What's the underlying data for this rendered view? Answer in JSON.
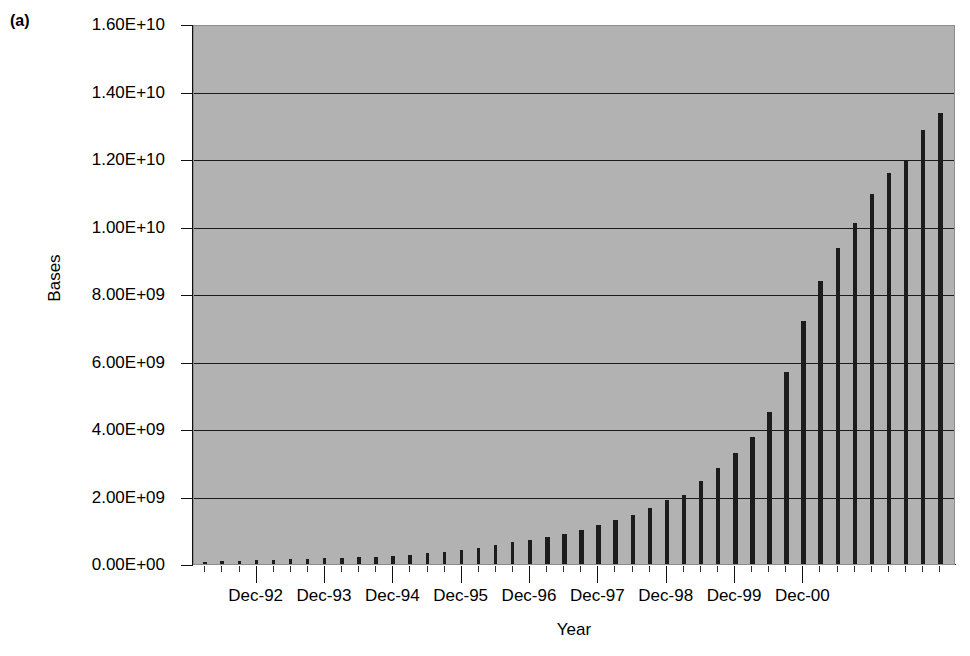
{
  "figure": {
    "panel_label": "(a)",
    "background_color": "#ffffff",
    "plot_background_color": "#b2b2b2",
    "bar_color": "#1c1c1c",
    "gridline_color": "#1a1a1a"
  },
  "axes": {
    "ylabel": "Bases",
    "xlabel": "Year",
    "ytick_labels": [
      "0.00E+00",
      "2.00E+09",
      "4.00E+09",
      "6.00E+09",
      "8.00E+09",
      "1.00E+10",
      "1.20E+10",
      "1.40E+10",
      "1.60E+10"
    ],
    "ytick_values": [
      0,
      2000000000,
      4000000000,
      6000000000,
      8000000000,
      10000000000,
      12000000000,
      14000000000,
      16000000000
    ],
    "xtick_labels": [
      "Dec-92",
      "Dec-93",
      "Dec-94",
      "Dec-95",
      "Dec-96",
      "Dec-97",
      "Dec-98",
      "Dec-99",
      "Dec-00"
    ]
  },
  "chart_data": {
    "type": "bar",
    "title": "",
    "subtitle": "",
    "xlabel": "Year",
    "ylabel": "Bases",
    "ylim": [
      0,
      16000000000
    ],
    "ytick_labels": [
      "0.00E+00",
      "2.00E+09",
      "4.00E+09",
      "6.00E+09",
      "8.00E+09",
      "1.00E+10",
      "1.20E+10",
      "1.40E+10",
      "1.60E+10"
    ],
    "grid": true,
    "legend": null,
    "legend_position": "none",
    "annotations": [
      "(a)"
    ],
    "categories": [
      "Mar-92",
      "Jun-92",
      "Sep-92",
      "Dec-92",
      "Mar-93",
      "Jun-93",
      "Sep-93",
      "Dec-93",
      "Mar-94",
      "Jun-94",
      "Sep-94",
      "Dec-94",
      "Mar-95",
      "Jun-95",
      "Sep-95",
      "Dec-95",
      "Mar-96",
      "Jun-96",
      "Sep-96",
      "Dec-96",
      "Mar-97",
      "Jun-97",
      "Sep-97",
      "Dec-97",
      "Mar-98",
      "Jun-98",
      "Sep-98",
      "Dec-98",
      "Mar-99",
      "Jun-99",
      "Sep-99",
      "Dec-99",
      "Mar-00",
      "Jun-00",
      "Sep-00",
      "Dec-00",
      "Mar-01",
      "Jun-01"
    ],
    "values": [
      60000000,
      75000000,
      90000000,
      105000000,
      120000000,
      135000000,
      150000000,
      165000000,
      180000000,
      200000000,
      220000000,
      250000000,
      280000000,
      320000000,
      360000000,
      420000000,
      480000000,
      560000000,
      640000000,
      720000000,
      810000000,
      900000000,
      1020000000,
      1150000000,
      1300000000,
      1450000000,
      1650000000,
      1900000000,
      2050000000,
      2450000000,
      2850000000,
      3300000000,
      3750000000,
      4500000000,
      5700000000,
      7200000000,
      8400000000,
      9350000000
    ],
    "values_tail": [
      10100000000,
      10950000000,
      11600000000,
      11950000000,
      12850000000,
      13350000000
    ],
    "categories_tail": [
      "Sep-01",
      "Dec-01",
      "Mar-02",
      "Jun-02",
      "Sep-02",
      "Dec-02"
    ],
    "bar_count": 44,
    "ymax": 16000000000
  }
}
